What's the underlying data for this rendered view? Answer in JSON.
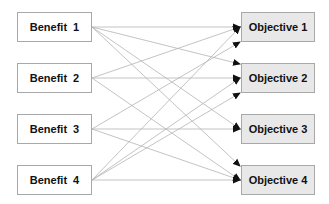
{
  "diagram": {
    "benefits": [
      {
        "label": "Benefit  1"
      },
      {
        "label": "Benefit  2"
      },
      {
        "label": "Benefit  3"
      },
      {
        "label": "Benefit  4"
      }
    ],
    "objectives": [
      {
        "label": "Objective 1"
      },
      {
        "label": "Objective 2"
      },
      {
        "label": "Objective 3"
      },
      {
        "label": "Objective 4"
      }
    ],
    "connections": [
      {
        "from": "Benefit 1",
        "to": "Objective 1"
      },
      {
        "from": "Benefit 1",
        "to": "Objective 2"
      },
      {
        "from": "Benefit 1",
        "to": "Objective 3"
      },
      {
        "from": "Benefit 1",
        "to": "Objective 4"
      },
      {
        "from": "Benefit 2",
        "to": "Objective 1"
      },
      {
        "from": "Benefit 2",
        "to": "Objective 2"
      },
      {
        "from": "Benefit 2",
        "to": "Objective 4"
      },
      {
        "from": "Benefit 3",
        "to": "Objective 1"
      },
      {
        "from": "Benefit 3",
        "to": "Objective 3"
      },
      {
        "from": "Benefit 3",
        "to": "Objective 4"
      },
      {
        "from": "Benefit 4",
        "to": "Objective 1"
      },
      {
        "from": "Benefit 4",
        "to": "Objective 2"
      },
      {
        "from": "Benefit 4",
        "to": "Objective 3"
      },
      {
        "from": "Benefit 4",
        "to": "Objective 4"
      }
    ],
    "colors": {
      "line": "#b4b4b4",
      "arrowhead": "#111111",
      "benefit_fill": "#ffffff",
      "objective_fill": "#e8e8e8",
      "border": "#a8a8a8"
    }
  }
}
